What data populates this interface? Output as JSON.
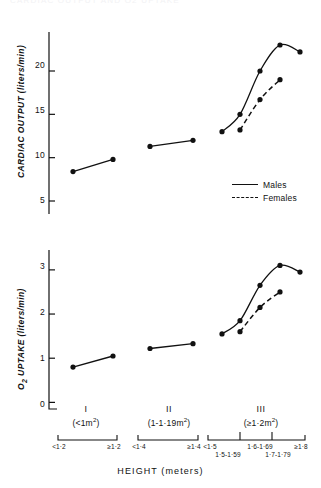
{
  "figure": {
    "top_cut_text": "CARDIAC OUTPUT AND O2 UPTAKE",
    "x_axis_title": "HEIGHT (meters)"
  },
  "legend": {
    "position": "inside-top-chart-right",
    "items": [
      {
        "label": "Males",
        "style": "solid",
        "key": "line-solid-icon"
      },
      {
        "label": "Females",
        "style": "dashed",
        "key": "line-dashed-icon"
      }
    ]
  },
  "groups": [
    {
      "roman": "I",
      "area": "(<1m2)",
      "area_prefix": "(<1m",
      "area_sup": "2",
      "area_suffix": ")",
      "subcats_top": [
        "<1·2",
        "≥1·2"
      ],
      "subcats_bottom": []
    },
    {
      "roman": "II",
      "area": "(1-1·19m2)",
      "area_prefix": "(1-1·19m",
      "area_sup": "2",
      "area_suffix": ")",
      "subcats_top": [
        "<1·4",
        "≥1·4"
      ],
      "subcats_bottom": []
    },
    {
      "roman": "III",
      "area": "(≥1·2m2)",
      "area_prefix": "(≥1·2m",
      "area_sup": "2",
      "area_suffix": ")",
      "subcats_top": [
        "<1·5",
        "1·6-1·69",
        "≥1·8"
      ],
      "subcats_bottom": [
        "1·5-1·59",
        "1·7-1·79"
      ]
    }
  ],
  "chart_data": [
    {
      "type": "line",
      "id": "cardiac-output-chart",
      "title": "",
      "ylabel": "CARDIAC OUTPUT (liters/min)",
      "xlabel": "HEIGHT (meters)",
      "ylim": [
        3.5,
        24.5
      ],
      "yticks": [
        5,
        10,
        15,
        20
      ],
      "ytick_labels": [
        "5",
        "10",
        "15",
        "20"
      ],
      "grid": false,
      "legend": [
        "Males",
        "Females"
      ],
      "series": [
        {
          "name": "Males",
          "style": "solid",
          "groups": [
            {
              "group": "I",
              "x": [
                "<1·2",
                "≥1·2"
              ],
              "values": [
                8.4,
                9.8
              ]
            },
            {
              "group": "II",
              "x": [
                "<1·4",
                "≥1·4"
              ],
              "values": [
                11.3,
                12.0
              ]
            },
            {
              "group": "III",
              "x": [
                "<1·5",
                "1·5-1·59",
                "1·6-1·69",
                "1·7-1·79",
                "≥1·8"
              ],
              "values": [
                13.0,
                15.0,
                20.0,
                23.0,
                22.2
              ]
            }
          ]
        },
        {
          "name": "Females",
          "style": "dashed",
          "groups": [
            {
              "group": "III",
              "x": [
                "1·5-1·59",
                "1·6-1·69",
                "1·7-1·79"
              ],
              "values": [
                13.2,
                16.7,
                19.0
              ]
            }
          ]
        }
      ]
    },
    {
      "type": "line",
      "id": "o2-uptake-chart",
      "title": "",
      "ylabel": "O2 UPTAKE (liters/min)",
      "xlabel": "HEIGHT (meters)",
      "ylim": [
        -0.15,
        3.45
      ],
      "yticks": [
        0,
        1,
        2,
        3
      ],
      "ytick_labels": [
        "0",
        "1",
        "2",
        "3"
      ],
      "grid": false,
      "legend": [
        "Males",
        "Females"
      ],
      "series": [
        {
          "name": "Males",
          "style": "solid",
          "groups": [
            {
              "group": "I",
              "x": [
                "<1·2",
                "≥1·2"
              ],
              "values": [
                0.8,
                1.05
              ]
            },
            {
              "group": "II",
              "x": [
                "<1·4",
                "≥1·4"
              ],
              "values": [
                1.22,
                1.33
              ]
            },
            {
              "group": "III",
              "x": [
                "<1·5",
                "1·5-1·59",
                "1·6-1·69",
                "1·7-1·79",
                "≥1·8"
              ],
              "values": [
                1.55,
                1.85,
                2.65,
                3.1,
                2.95
              ]
            }
          ]
        },
        {
          "name": "Females",
          "style": "dashed",
          "groups": [
            {
              "group": "III",
              "x": [
                "1·5-1·59",
                "1·6-1·69",
                "1·7-1·79"
              ],
              "values": [
                1.6,
                2.15,
                2.5
              ]
            }
          ]
        }
      ]
    }
  ]
}
